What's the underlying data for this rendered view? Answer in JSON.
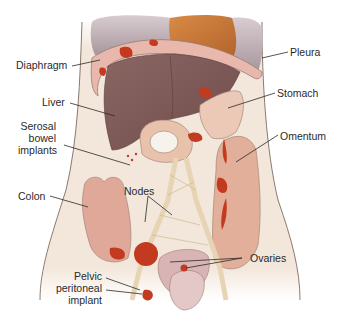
{
  "diagram": {
    "type": "anatomical-illustration",
    "colors": {
      "background": "#ffffff",
      "body": "#f3e6da",
      "body_outline": "#8a7a70",
      "lung_pleura": "#b7a8ad",
      "heart": "#c67a3c",
      "liver": "#7e5b58",
      "diaphragm": "#e8b8ac",
      "stomach": "#e8bfae",
      "bowel": "#ddb09a",
      "implant": "#c23a1f",
      "vessels": "#e6d4b4",
      "uterus": "#d9b4b4",
      "label_text": "#2a2a2a",
      "leader_line": "#2a2a2a"
    },
    "labels": {
      "diaphragm": "Diaphragm",
      "pleura": "Pleura",
      "liver": "Liver",
      "stomach": "Stomach",
      "serosal_line1": "Serosal",
      "serosal_line2": "bowel",
      "serosal_line3": "implants",
      "omentum": "Omentum",
      "colon": "Colon",
      "nodes": "Nodes",
      "ovaries": "Ovaries",
      "pelvic_line1": "Pelvic",
      "pelvic_line2": "peritoneal",
      "pelvic_line3": "implant"
    }
  }
}
